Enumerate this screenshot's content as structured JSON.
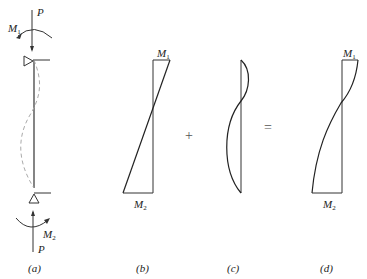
{
  "diagram": {
    "panels": [
      {
        "id": "a",
        "caption": "(a)",
        "labels": {
          "load_top": "P",
          "load_bottom": "P",
          "moment_top": "M",
          "moment_top_sub": "1",
          "moment_bottom": "M",
          "moment_bottom_sub": "2"
        }
      },
      {
        "id": "b",
        "caption": "(b)",
        "labels": {
          "top": "M",
          "top_sub": "1",
          "bottom": "M",
          "bottom_sub": "2"
        }
      },
      {
        "id": "c",
        "caption": "(c)"
      },
      {
        "id": "d",
        "caption": "(d)",
        "labels": {
          "top": "M",
          "top_sub": "1",
          "bottom": "M",
          "bottom_sub": "2"
        }
      }
    ],
    "operators": {
      "plus": "+",
      "equals": "="
    },
    "colors": {
      "line": "#222222",
      "dashed": "#aaaaaa"
    }
  }
}
